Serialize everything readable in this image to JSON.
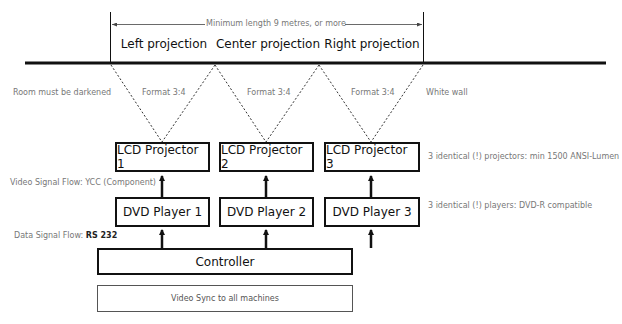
{
  "title_bar": {
    "min_length_label": "Minimum length 9 metres, or more"
  },
  "projections": [
    {
      "label": "Left projection"
    },
    {
      "label": "Center projection"
    },
    {
      "label": "Right projection"
    }
  ],
  "beam_labels": {
    "left_note": "Room must be darkened",
    "formats": [
      "Format 3:4",
      "Format 3:4",
      "Format 3:4"
    ],
    "right_note": "White wall"
  },
  "projectors": [
    {
      "label": "LCD Projector 1"
    },
    {
      "label": "LCD Projector 2"
    },
    {
      "label": "LCD Projector 3"
    }
  ],
  "projector_note": "3 identical (!) projectors: min 1500 ANSI-Lumen",
  "video_signal_label": "Video Signal Flow: YCC (Component)",
  "players": [
    {
      "label": "DVD Player 1"
    },
    {
      "label": "DVD Player 2"
    },
    {
      "label": "DVD Player 3"
    }
  ],
  "player_note": "3 identical (!) players: DVD-R compatible",
  "data_signal": {
    "prefix": "Data Signal Flow: ",
    "protocol": "RS 232"
  },
  "controller": {
    "label": "Controller"
  },
  "sync": {
    "label": "Video Sync to all machines"
  }
}
